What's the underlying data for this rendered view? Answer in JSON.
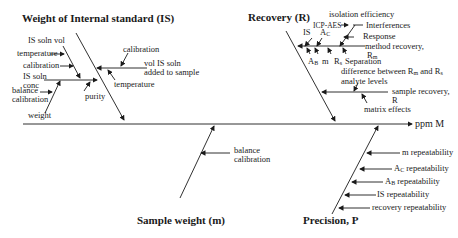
{
  "diagram": {
    "type": "fishbone",
    "effect": "ppm M",
    "categories": {
      "weight_is": {
        "title": "Weight of Internal standard (IS)",
        "causes": [
          "IS soln vol",
          "temperature",
          "calibration",
          "IS soln conc",
          "balance calibration",
          "weight",
          "purity",
          "calibration",
          "vol IS soln added to sample",
          "temperature"
        ]
      },
      "recovery": {
        "title": "Recovery (R)",
        "causes": [
          "isolation efficiency",
          "ICP-AES",
          "Interferences",
          "Response",
          "IS",
          "A",
          "C",
          "method recovery,",
          "R",
          "m",
          "A",
          "B",
          "m",
          "R",
          "s",
          "Separation",
          "difference between R",
          "m",
          " and R",
          "s",
          "analyte levels",
          "sample recovery,",
          "R",
          "matrix effects"
        ]
      },
      "sample_weight": {
        "title": "Sample weight (m)",
        "causes": [
          "balance",
          "calibration"
        ]
      },
      "precision": {
        "title": "Precision, P",
        "causes": [
          "m repeatability",
          "A",
          "C",
          " repeatability",
          "A",
          "B",
          " repeatability",
          "IS repeatability",
          "recovery repeatability"
        ]
      }
    }
  }
}
